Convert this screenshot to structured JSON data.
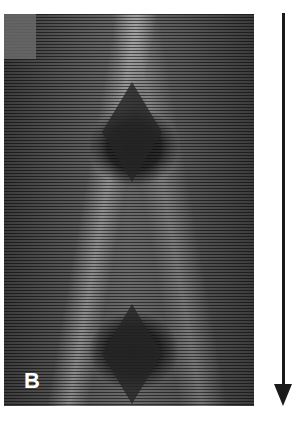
{
  "figure": {
    "panel_label": "B",
    "image_description": "grayscale striped microscopy image with two dark diamond-shaped regions",
    "arrow": {
      "direction": "down",
      "color": "#1a1a1a"
    }
  }
}
